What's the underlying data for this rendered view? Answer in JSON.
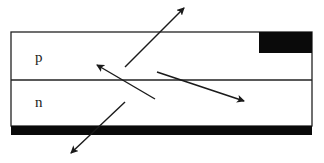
{
  "diagram": {
    "title": "",
    "type": "p-n junction (LED) light emission",
    "colors": {
      "background": "#ffffff",
      "outline": "#222222",
      "contact": "#0a0a0a",
      "arrow": "#1a1a1a"
    },
    "device": {
      "box": {
        "x": 11,
        "y": 32,
        "width": 301,
        "height": 94
      },
      "junction_y": 80
    },
    "regions": [
      {
        "id": "p-region",
        "label": "p",
        "label_x": 35,
        "label_y": 62
      },
      {
        "id": "n-region",
        "label": "n",
        "label_x": 35,
        "label_y": 107
      }
    ],
    "contacts": [
      {
        "id": "top-contact",
        "x": 259,
        "y": 32,
        "width": 53,
        "height": 21
      },
      {
        "id": "bottom-contact",
        "x": 11,
        "y": 126,
        "width": 301,
        "height": 9
      }
    ],
    "arrows": [
      {
        "id": "arrow-up-right",
        "x1": 125,
        "y1": 67,
        "x2": 184,
        "y2": 8
      },
      {
        "id": "arrow-up-left",
        "x1": 155,
        "y1": 99,
        "x2": 97,
        "y2": 65
      },
      {
        "id": "arrow-down-right",
        "x1": 157,
        "y1": 72,
        "x2": 244,
        "y2": 101
      },
      {
        "id": "arrow-down-left",
        "x1": 125,
        "y1": 102,
        "x2": 71,
        "y2": 153
      }
    ]
  }
}
